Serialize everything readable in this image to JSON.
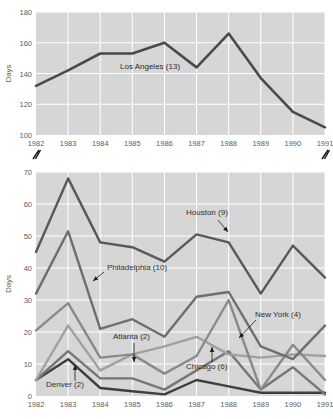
{
  "figure": {
    "background": "#ffffff",
    "plot_background": "#d6d6d6",
    "gridline_color": "#ffffff",
    "axis_break_marker": "double-slash"
  },
  "chart_data": [
    {
      "type": "line",
      "id": "top-panel",
      "title": "",
      "xlabel": "",
      "ylabel": "Days",
      "x": [
        1982,
        1983,
        1984,
        1985,
        1986,
        1987,
        1988,
        1989,
        1990,
        1991
      ],
      "xticklabels": [
        "1982",
        "1983",
        "1984",
        "1985",
        "1986",
        "1987",
        "1988",
        "1989",
        "1990",
        "1991"
      ],
      "yticklabels": [
        "100",
        "120",
        "140",
        "160",
        "180"
      ],
      "yticks": [
        100,
        120,
        140,
        160,
        180
      ],
      "ylim": [
        100,
        180
      ],
      "xlim": [
        1982,
        1991
      ],
      "grid": true,
      "legend_position": "inline-annotation",
      "series": [
        {
          "name": "Los Angeles (13)",
          "label": "Los Angeles (13)",
          "color": "#4a4a4a",
          "linewidth": 2.6,
          "values": [
            132,
            142,
            153,
            153,
            160,
            144,
            166,
            137,
            115,
            105
          ]
        }
      ]
    },
    {
      "type": "line",
      "id": "bottom-panel",
      "title": "",
      "xlabel": "",
      "ylabel": "Days",
      "x": [
        1982,
        1983,
        1984,
        1985,
        1986,
        1987,
        1988,
        1989,
        1990,
        1991
      ],
      "xticklabels": [
        "1982",
        "1983",
        "1984",
        "1985",
        "1986",
        "1987",
        "1988",
        "1989",
        "1990",
        "1991"
      ],
      "yticklabels": [
        "0",
        "10",
        "20",
        "30",
        "40",
        "50",
        "60",
        "70"
      ],
      "yticks": [
        0,
        10,
        20,
        30,
        40,
        50,
        60,
        70
      ],
      "ylim": [
        0,
        70
      ],
      "xlim": [
        1982,
        1991
      ],
      "grid": true,
      "legend_position": "inline-annotation",
      "series": [
        {
          "name": "Houston (9)",
          "label": "Houston (9)",
          "color": "#595959",
          "linewidth": 2.4,
          "values": [
            45,
            68,
            48,
            46.5,
            42,
            50.5,
            48,
            32,
            47,
            37
          ]
        },
        {
          "name": "Philadelphia (10)",
          "label": "Philadelphia (10)",
          "color": "#6e6e6e",
          "linewidth": 2.4,
          "values": [
            32,
            51.5,
            21,
            24,
            18.5,
            31,
            32.5,
            15.5,
            11.5,
            22
          ]
        },
        {
          "name": "New York (4)",
          "label": "New York (4)",
          "color": "#8a8a8a",
          "linewidth": 2.4,
          "values": [
            20.5,
            29,
            12,
            13,
            7,
            12.5,
            30,
            2,
            16,
            5
          ]
        },
        {
          "name": "Atlanta (2)",
          "label": "Atlanta (2)",
          "color": "#a0a0a0",
          "linewidth": 2.4,
          "values": [
            5,
            22,
            8,
            13,
            15.5,
            18.5,
            13,
            12,
            13,
            12.5
          ]
        },
        {
          "name": "Chicago (6)",
          "label": "Chicago (6)",
          "color": "#767676",
          "linewidth": 2.4,
          "values": [
            5,
            14,
            5.5,
            5.5,
            2,
            8,
            14,
            2,
            9,
            0.5
          ]
        },
        {
          "name": "Denver (2)",
          "label": "Denver (2)",
          "color": "#3f3f3f",
          "linewidth": 2.4,
          "values": [
            5,
            11.5,
            2.5,
            1.5,
            0.5,
            5,
            3,
            1,
            1,
            1
          ]
        }
      ]
    }
  ],
  "annotations": {
    "top": [
      {
        "text": "Los Angeles (13)",
        "x": 120,
        "y": 69,
        "leader": false
      }
    ],
    "bottom": [
      {
        "text": "Houston (9)",
        "x": 186,
        "y": 215,
        "leader": true
      },
      {
        "text": "Philadelphia (10)",
        "x": 107,
        "y": 270,
        "leader": true
      },
      {
        "text": "New York (4)",
        "x": 255,
        "y": 317,
        "leader": true
      },
      {
        "text": "Atlanta (2)",
        "x": 113,
        "y": 339,
        "leader": true
      },
      {
        "text": "Chicago (6)",
        "x": 186,
        "y": 369,
        "leader": true
      },
      {
        "text": "Denver (2)",
        "x": 46,
        "y": 387,
        "leader": true
      }
    ]
  }
}
